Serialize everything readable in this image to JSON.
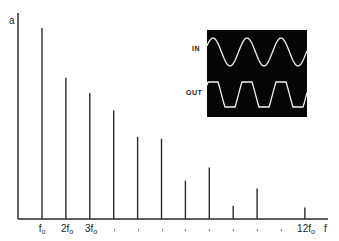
{
  "chart_data": {
    "type": "bar",
    "title": "",
    "subtitle": "Harmonic spectrum of clipped output signal",
    "xlabel": "f",
    "ylabel": "a",
    "categories": [
      "f0",
      "2f0",
      "3f0",
      "4f0",
      "5f0",
      "6f0",
      "7f0",
      "8f0",
      "9f0",
      "10f0",
      "11f0",
      "12f0"
    ],
    "tick_labels_visible": [
      "f₀",
      "2f₀",
      "3f₀",
      ".",
      ".",
      ".",
      ".",
      ".",
      ".",
      ".",
      ".",
      "12f₀"
    ],
    "values": [
      1.0,
      0.74,
      0.66,
      0.57,
      0.43,
      0.42,
      0.2,
      0.27,
      0.07,
      0.16,
      0.0,
      0.06
    ],
    "ylim": [
      0,
      1.05
    ],
    "grid": false,
    "legend": null,
    "inset": {
      "type": "oscilloscope-waveform",
      "background": "#000000",
      "trace_color": "#ffffff",
      "traces": [
        {
          "label": "IN",
          "shape": "sine",
          "cycles": 3
        },
        {
          "label": "OUT",
          "shape": "clipped-sine",
          "cycles": 3
        }
      ]
    }
  },
  "axes": {
    "y_label": "a",
    "x_label": "f"
  },
  "ticks": [
    {
      "main": "f",
      "sub": "o"
    },
    {
      "main": "2f",
      "sub": "o"
    },
    {
      "main": "3f",
      "sub": "o"
    },
    {
      "main": "12f",
      "sub": "o"
    }
  ],
  "inset": {
    "in_label": "IN",
    "out_label": "OUT"
  },
  "colors": {
    "line": "#2a2a2a",
    "inset_bg": "#050505",
    "trace": "#f2f2f2"
  }
}
